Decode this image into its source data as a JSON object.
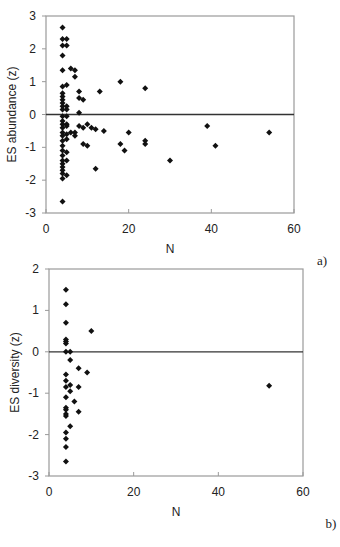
{
  "chart_data": [
    {
      "type": "scatter",
      "panel_label": "a)",
      "xlabel": "N",
      "ylabel": "ES abundance (z)",
      "xlim": [
        0,
        60
      ],
      "ylim": [
        -3,
        3
      ],
      "xticks": [
        0,
        20,
        40,
        60
      ],
      "yticks": [
        -3,
        -2,
        -1,
        0,
        1,
        2,
        3
      ],
      "reference_line_y": 0,
      "grid": false,
      "points": [
        [
          4,
          2.65
        ],
        [
          4,
          2.3
        ],
        [
          5,
          2.3
        ],
        [
          4,
          2.1
        ],
        [
          5,
          2.1
        ],
        [
          4,
          1.8
        ],
        [
          4,
          1.35
        ],
        [
          6,
          1.4
        ],
        [
          7,
          1.35
        ],
        [
          7,
          1.15
        ],
        [
          4,
          0.85
        ],
        [
          5,
          0.9
        ],
        [
          4,
          0.65
        ],
        [
          4,
          0.55
        ],
        [
          4,
          0.45
        ],
        [
          4,
          0.35
        ],
        [
          4,
          0.25
        ],
        [
          5,
          0.25
        ],
        [
          4,
          0.15
        ],
        [
          5,
          0.15
        ],
        [
          8,
          0.7
        ],
        [
          8,
          0.5
        ],
        [
          9,
          0.45
        ],
        [
          13,
          0.7
        ],
        [
          18,
          1.0
        ],
        [
          24,
          0.8
        ],
        [
          8,
          0.05
        ],
        [
          4,
          -0.05
        ],
        [
          5,
          -0.05
        ],
        [
          4,
          -0.2
        ],
        [
          4,
          -0.3
        ],
        [
          5,
          -0.3
        ],
        [
          4,
          -0.4
        ],
        [
          5,
          -0.35
        ],
        [
          8,
          -0.35
        ],
        [
          9,
          -0.4
        ],
        [
          10,
          -0.3
        ],
        [
          11,
          -0.4
        ],
        [
          12,
          -0.45
        ],
        [
          14,
          -0.5
        ],
        [
          20,
          -0.55
        ],
        [
          39,
          -0.35
        ],
        [
          4,
          -0.55
        ],
        [
          4,
          -0.65
        ],
        [
          5,
          -0.6
        ],
        [
          6,
          -0.55
        ],
        [
          7,
          -0.65
        ],
        [
          4,
          -0.8
        ],
        [
          5,
          -0.75
        ],
        [
          7,
          -0.55
        ],
        [
          4,
          -0.95
        ],
        [
          9,
          -0.9
        ],
        [
          10,
          -0.95
        ],
        [
          18,
          -0.9
        ],
        [
          24,
          -0.8
        ],
        [
          24,
          -0.9
        ],
        [
          19,
          -1.1
        ],
        [
          41,
          -0.95
        ],
        [
          54,
          -0.55
        ],
        [
          4,
          -1.1
        ],
        [
          5,
          -1.15
        ],
        [
          4,
          -1.25
        ],
        [
          4,
          -1.4
        ],
        [
          5,
          -1.4
        ],
        [
          12,
          -1.65
        ],
        [
          30,
          -1.4
        ],
        [
          4,
          -1.5
        ],
        [
          4,
          -1.6
        ],
        [
          4,
          -1.7
        ],
        [
          4,
          -1.8
        ],
        [
          5,
          -1.85
        ],
        [
          4,
          -1.95
        ],
        [
          4,
          -2.65
        ]
      ]
    },
    {
      "type": "scatter",
      "panel_label": "b)",
      "xlabel": "N",
      "ylabel": "ES diversity (z)",
      "xlim": [
        0,
        60
      ],
      "ylim": [
        -3,
        2
      ],
      "xticks": [
        0,
        20,
        40,
        60
      ],
      "yticks": [
        -3,
        -2,
        -1,
        0,
        1,
        2
      ],
      "reference_line_y": 0,
      "grid": false,
      "points": [
        [
          4,
          1.5
        ],
        [
          4,
          1.15
        ],
        [
          4,
          0.7
        ],
        [
          10,
          0.5
        ],
        [
          4,
          0.3
        ],
        [
          4,
          0.25
        ],
        [
          4,
          0.2
        ],
        [
          4,
          0.0
        ],
        [
          5,
          0.0
        ],
        [
          5,
          -0.2
        ],
        [
          7,
          -0.4
        ],
        [
          9,
          -0.5
        ],
        [
          4,
          -0.55
        ],
        [
          4,
          -0.7
        ],
        [
          5,
          -0.8
        ],
        [
          4,
          -0.85
        ],
        [
          5,
          -0.95
        ],
        [
          7,
          -0.85
        ],
        [
          4,
          -1.1
        ],
        [
          6,
          -1.2
        ],
        [
          4,
          -1.35
        ],
        [
          4,
          -1.4
        ],
        [
          7,
          -1.45
        ],
        [
          4,
          -1.5
        ],
        [
          4,
          -1.55
        ],
        [
          5,
          -1.8
        ],
        [
          4,
          -1.95
        ],
        [
          4,
          -2.1
        ],
        [
          4,
          -2.3
        ],
        [
          4,
          -2.65
        ],
        [
          52,
          -0.82
        ]
      ]
    }
  ]
}
